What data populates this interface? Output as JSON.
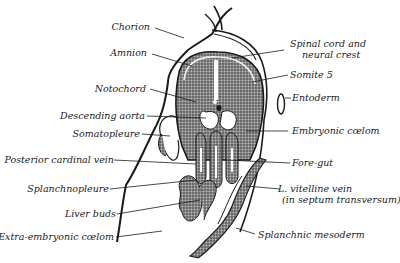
{
  "figure": {
    "labels_left": [
      {
        "id": "chorion",
        "text": "Chorion"
      },
      {
        "id": "amnion",
        "text": "Amnion"
      },
      {
        "id": "notochord",
        "text": "Notochord"
      },
      {
        "id": "descending_aorta",
        "text": "Descending aorta"
      },
      {
        "id": "somatopleure",
        "text": "Somatopleure"
      },
      {
        "id": "posterior_cardinal_vein",
        "text": "Posterior cardinal vein"
      },
      {
        "id": "splanchnopleure",
        "text": "Splanchnopleure"
      },
      {
        "id": "liver_buds",
        "text": "Liver buds"
      },
      {
        "id": "extra_embryonic_coelom",
        "text": "Extra-embryonic cœlom"
      }
    ],
    "labels_right": [
      {
        "id": "spinal_cord_line1",
        "text": "Spinal cord and"
      },
      {
        "id": "spinal_cord_line2",
        "text": "neural crest"
      },
      {
        "id": "somite5",
        "text": "Somite 5"
      },
      {
        "id": "entoderm",
        "text": "Entoderm"
      },
      {
        "id": "embryonic_coelom",
        "text": "Embryonic cœlom"
      },
      {
        "id": "fore_gut",
        "text": "Fore-gut"
      },
      {
        "id": "vitelline_line1",
        "text": "L. vitelline vein"
      },
      {
        "id": "vitelline_line2",
        "text": "(in septum transversum)"
      },
      {
        "id": "splanchnic_mesoderm",
        "text": "Splanchnic mesoderm"
      }
    ],
    "colors": {
      "ink": "#1a1a1a",
      "tissue": "#6b6b6b",
      "background": "#ffffff"
    }
  }
}
